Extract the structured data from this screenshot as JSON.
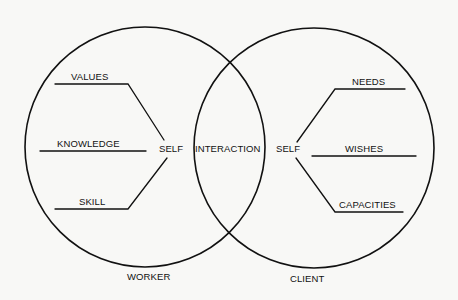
{
  "diagram": {
    "type": "venn",
    "colors": {
      "background": "#f8f8f6",
      "ink": "#111111"
    },
    "circles": {
      "left": {
        "label": "WORKER",
        "center_label": "SELF",
        "attributes": [
          {
            "label": "VALUES"
          },
          {
            "label": "KNOWLEDGE"
          },
          {
            "label": "SKILL"
          }
        ]
      },
      "right": {
        "label": "CLIENT",
        "center_label": "SELF",
        "attributes": [
          {
            "label": "NEEDS"
          },
          {
            "label": "WISHES"
          },
          {
            "label": "CAPACITIES"
          }
        ]
      }
    },
    "overlap_label": "INTERACTION"
  }
}
